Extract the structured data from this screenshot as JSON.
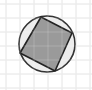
{
  "diagram": {
    "type": "geometry",
    "canvas": {
      "width": 92,
      "height": 90
    },
    "grid": {
      "color": "#e2e2e2",
      "step": 14,
      "x_lines": [
        6,
        20,
        34,
        48,
        62,
        76,
        90
      ],
      "y_lines": [
        4,
        18,
        32,
        46,
        60,
        74,
        88
      ]
    },
    "circle": {
      "cx": 47,
      "cy": 44,
      "r": 28,
      "fill": "#ececec",
      "stroke": "#333333",
      "stroke_width": 1.6
    },
    "square": {
      "points": [
        [
          41,
          17
        ],
        [
          72,
          33
        ],
        [
          55,
          71
        ],
        [
          20,
          53
        ]
      ],
      "fill": "#8c8c8c",
      "fill_opacity": 0.85,
      "stroke": "#222222",
      "stroke_width": 1.6
    }
  }
}
